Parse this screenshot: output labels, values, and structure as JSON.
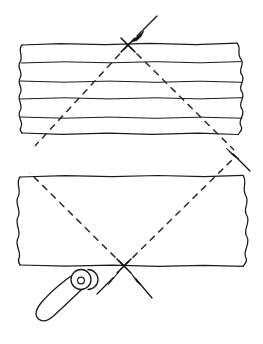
{
  "figure": {
    "title": "Aligning two workpiece strips with a seam roller",
    "background_color": "#ffffff",
    "ink_color": "#1a1a1a",
    "width": 263,
    "height": 344
  },
  "parts": {
    "upper_strip": {
      "name": "Upper layered strip",
      "label": "",
      "x": 20,
      "y": 43,
      "width": 225,
      "height": 92,
      "torn_edges": [
        "left",
        "right"
      ],
      "internal_line_count": 4
    },
    "lower_strip": {
      "name": "Lower plain strip",
      "label": "",
      "x": 18,
      "y": 175,
      "width": 227,
      "height": 90,
      "torn_edges": [
        "left",
        "right"
      ],
      "internal_line_count": 0
    },
    "roller_tool": {
      "name": "Seam roller tool",
      "label": "",
      "wheel_center_x": 84,
      "wheel_center_y": 279,
      "wheel_radius": 10,
      "hub_radius": 3.4,
      "handle_tip_x": 38,
      "handle_tip_y": 318
    }
  },
  "guides": {
    "dashed_line_a": {
      "name": "Dashed guide line A",
      "from_x": 40,
      "from_y": 150,
      "to_x": 236,
      "to_y": 157,
      "dash_pattern": "7 5"
    },
    "dashed_line_b": {
      "name": "Dashed guide line B",
      "from_x": 33,
      "from_y": 172,
      "to_x": 222,
      "to_y": 178,
      "dash_pattern": "7 5"
    }
  },
  "marks": {
    "top_cross": {
      "name": "Registration cross on upper strip top edge",
      "x": 128,
      "y": 45,
      "size": 11
    },
    "bottom_cross": {
      "name": "Registration cross on lower strip bottom edge",
      "x": 124,
      "y": 266,
      "size": 11
    }
  },
  "arrows": [
    {
      "id": "arrow-top",
      "name": "Arrow pointing to top registration cross",
      "direction": "down-left",
      "tail_x": 157,
      "tail_y": 16,
      "tip_x": 131,
      "tip_y": 42
    },
    {
      "id": "arrow-right",
      "name": "Arrow pointing up-left between strips",
      "direction": "up-left",
      "tail_x": 249,
      "tail_y": 170,
      "tip_x": 226,
      "tip_y": 148
    },
    {
      "id": "arrow-bottom-left",
      "name": "Left arrow converging on bottom cross",
      "direction": "up-right",
      "tail_x": 99,
      "tail_y": 292,
      "tip_x": 119,
      "tip_y": 272
    },
    {
      "id": "arrow-bottom-right",
      "name": "Right arrow converging on bottom cross",
      "direction": "up-left",
      "tail_x": 150,
      "tail_y": 296,
      "tip_x": 131,
      "tip_y": 273
    }
  ]
}
